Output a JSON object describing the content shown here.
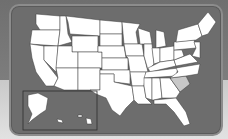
{
  "map": {
    "title": "United States",
    "highlighted_state": "South Carolina",
    "colors": {
      "panel": "#6d6d6d",
      "state_fill": "#ffffff",
      "state_border": "#3a3a3a",
      "highlight_fill": "#c8c8c8"
    },
    "inset": {
      "regions": [
        "Alaska",
        "Hawaii"
      ]
    }
  }
}
